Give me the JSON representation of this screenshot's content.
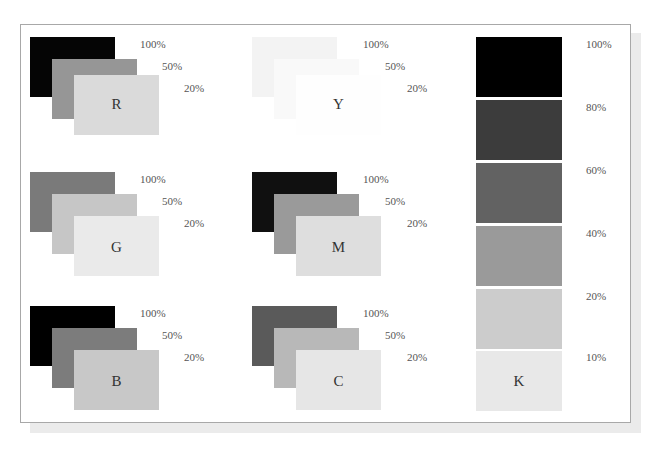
{
  "figure": {
    "title": "",
    "groups": [
      {
        "letter": "R",
        "levels": [
          "100%",
          "50%",
          "20%"
        ],
        "colors": [
          "#050505",
          "#969696",
          "#dadada"
        ]
      },
      {
        "letter": "Y",
        "levels": [
          "100%",
          "50%",
          "20%"
        ],
        "colors": [
          "#f3f3f3",
          "#f9f9f9",
          "#fdfdfd"
        ]
      },
      {
        "letter": "G",
        "levels": [
          "100%",
          "50%",
          "20%"
        ],
        "colors": [
          "#7a7a7a",
          "#c6c6c6",
          "#eaeaea"
        ]
      },
      {
        "letter": "M",
        "levels": [
          "100%",
          "50%",
          "20%"
        ],
        "colors": [
          "#101010",
          "#9a9a9a",
          "#dedede"
        ]
      },
      {
        "letter": "B",
        "levels": [
          "100%",
          "50%",
          "20%"
        ],
        "colors": [
          "#000000",
          "#7c7c7c",
          "#c8c8c8"
        ]
      },
      {
        "letter": "C",
        "levels": [
          "100%",
          "50%",
          "20%"
        ],
        "colors": [
          "#5a5a5a",
          "#b8b8b8",
          "#e6e6e6"
        ]
      }
    ],
    "k_scale": {
      "letter": "K",
      "levels": [
        "100%",
        "80%",
        "60%",
        "40%",
        "20%",
        "10%"
      ],
      "colors": [
        "#000000",
        "#3c3c3c",
        "#626262",
        "#9a9a9a",
        "#cccccc",
        "#e8e8e8"
      ]
    }
  }
}
